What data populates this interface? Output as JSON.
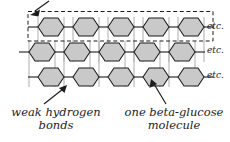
{
  "figure": {
    "background_color": "#ffffff",
    "hexagon_fill": "#c9c9c9",
    "hexagon_stroke": "#1d1d1d",
    "bond_line_color": "#b4b4b4",
    "dashed_box_color": "#1d1d1d",
    "text_color": "#1d1d1d"
  },
  "labels": {
    "etc_row_1": "etc.",
    "etc_row_2": "etc.",
    "etc_row_3": "etc.",
    "hydrogen_bonds_line_1": "weak hydrogen",
    "hydrogen_bonds_line_2": "bonds",
    "glucose_line_1": "one beta-glucose",
    "glucose_line_2": "molecule"
  },
  "diagram": {
    "rows": [
      {
        "name": "chain-row-1",
        "hexagon_count": 5,
        "enclosed_by_dashed_box": true
      },
      {
        "name": "chain-row-2",
        "hexagon_count": 5,
        "enclosed_by_dashed_box": false
      },
      {
        "name": "chain-row-3",
        "hexagon_count": 5,
        "enclosed_by_dashed_box": false
      }
    ],
    "dashed_box": {
      "name": "single-cellulose-chain-highlight",
      "encloses_row": 1
    },
    "arrows": [
      {
        "name": "arrow-to-cellulose-chain",
        "points_to": "dashed-box-top-left"
      },
      {
        "name": "arrow-to-hydrogen-bond",
        "points_to": "chain-row-3-junction"
      },
      {
        "name": "arrow-to-glucose-molecule",
        "points_to": "chain-row-3-hexagon-4"
      }
    ]
  }
}
